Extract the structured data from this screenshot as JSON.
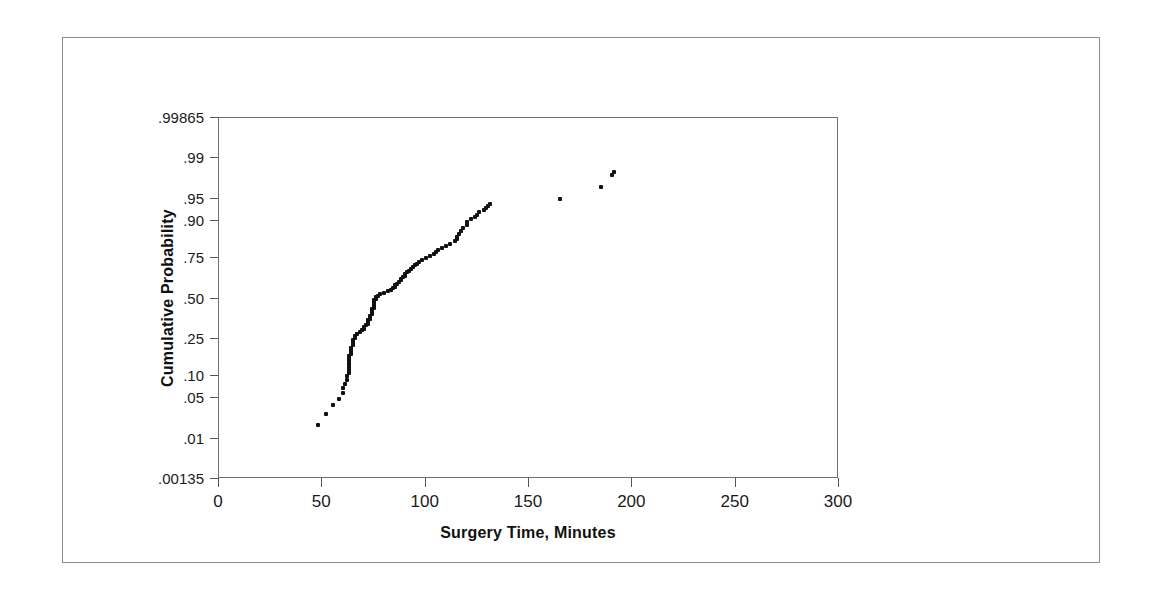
{
  "chart_data": {
    "type": "scatter",
    "title": "",
    "xlabel": "Surgery Time, Minutes",
    "ylabel": "Cumulative Probability",
    "plot_kind": "normal-probability-plot",
    "grid": false,
    "legend": null,
    "xlim": [
      0,
      300
    ],
    "xticks": [
      0,
      50,
      100,
      150,
      200,
      250,
      300
    ],
    "xtick_labels": [
      "0",
      "50",
      "100",
      "150",
      "200",
      "250",
      "300"
    ],
    "ylim": [
      0.00135,
      0.99865
    ],
    "yticks": [
      0.00135,
      0.01,
      0.05,
      0.1,
      0.25,
      0.5,
      0.75,
      0.9,
      0.95,
      0.99,
      0.99865
    ],
    "ytick_labels": [
      ".00135",
      ".01",
      ".05",
      ".10",
      ".25",
      ".50",
      ".75",
      ".90",
      ".95",
      ".99",
      ".99865"
    ],
    "y_scale": "probit",
    "marker": {
      "shape": "square",
      "color": "#111111",
      "size_px": 4
    },
    "series": [
      {
        "name": "Surgery Time",
        "x": [
          48,
          52,
          55,
          58,
          60,
          60,
          61,
          62,
          62,
          63,
          63,
          63,
          63,
          63,
          63,
          63,
          64,
          64,
          64,
          64,
          65,
          65,
          65,
          65,
          66,
          66,
          67,
          68,
          69,
          70,
          70,
          71,
          72,
          72,
          72,
          73,
          73,
          73,
          74,
          74,
          74,
          74,
          75,
          75,
          75,
          75,
          75,
          75,
          76,
          76,
          77,
          78,
          80,
          82,
          83,
          84,
          85,
          85,
          86,
          87,
          88,
          88,
          89,
          90,
          90,
          91,
          92,
          93,
          94,
          95,
          96,
          97,
          98,
          100,
          102,
          104,
          105,
          106,
          108,
          110,
          112,
          114,
          115,
          115,
          116,
          117,
          118,
          120,
          120,
          122,
          124,
          125,
          126,
          128,
          129,
          130,
          131,
          165,
          185,
          190,
          191
        ],
        "y": [
          0.018,
          0.028,
          0.038,
          0.048,
          0.058,
          0.068,
          0.078,
          0.088,
          0.098,
          0.108,
          0.118,
          0.128,
          0.138,
          0.148,
          0.158,
          0.168,
          0.178,
          0.188,
          0.198,
          0.208,
          0.218,
          0.228,
          0.238,
          0.248,
          0.258,
          0.268,
          0.278,
          0.288,
          0.298,
          0.308,
          0.318,
          0.328,
          0.338,
          0.348,
          0.358,
          0.368,
          0.378,
          0.388,
          0.398,
          0.408,
          0.418,
          0.428,
          0.438,
          0.448,
          0.458,
          0.468,
          0.478,
          0.488,
          0.498,
          0.508,
          0.518,
          0.528,
          0.538,
          0.548,
          0.558,
          0.568,
          0.578,
          0.588,
          0.598,
          0.608,
          0.618,
          0.628,
          0.638,
          0.648,
          0.658,
          0.668,
          0.678,
          0.688,
          0.698,
          0.708,
          0.718,
          0.728,
          0.738,
          0.748,
          0.758,
          0.768,
          0.778,
          0.788,
          0.798,
          0.808,
          0.818,
          0.828,
          0.838,
          0.848,
          0.858,
          0.868,
          0.878,
          0.888,
          0.898,
          0.905,
          0.912,
          0.918,
          0.924,
          0.93,
          0.934,
          0.938,
          0.942,
          0.95,
          0.968,
          0.98,
          0.982
        ]
      }
    ]
  }
}
